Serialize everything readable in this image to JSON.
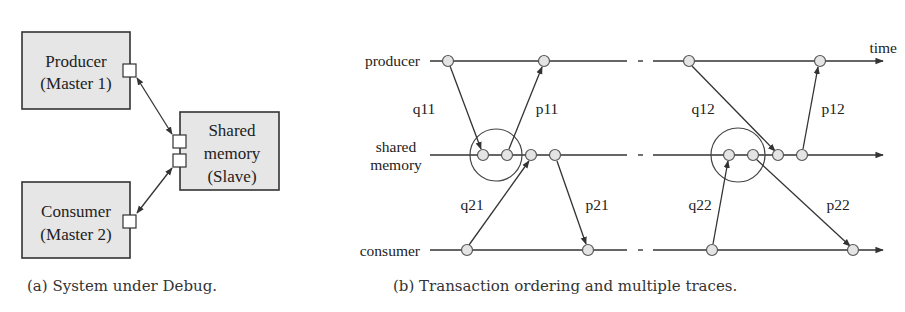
{
  "panel_a": {
    "caption": "(a) System under Debug.",
    "producer": {
      "line1": "Producer",
      "line2": "(Master 1)"
    },
    "shared": {
      "line1": "Shared",
      "line2": "memory",
      "line3": "(Slave)"
    },
    "consumer": {
      "line1": "Consumer",
      "line2": "(Master 2)"
    }
  },
  "panel_b": {
    "caption": "(b) Transaction ordering and multiple traces.",
    "axis": {
      "producer": "producer",
      "shared_line1": "shared",
      "shared_line2": "memory",
      "consumer": "consumer",
      "time": "time"
    },
    "messages": {
      "q11": "q11",
      "p11": "p11",
      "q21": "q21",
      "p21": "p21",
      "q12": "q12",
      "p12": "p12",
      "q22": "q22",
      "p22": "p22"
    }
  },
  "colors": {
    "box_fill": "#e6e6e6",
    "stroke": "#333333",
    "node_fill": "#e4e4e4"
  }
}
